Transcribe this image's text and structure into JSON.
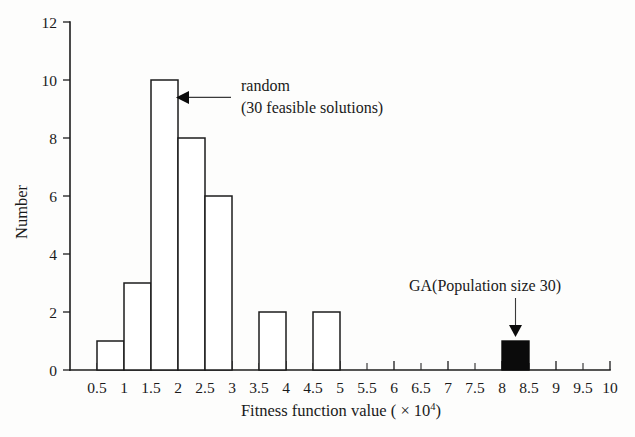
{
  "chart_data": {
    "type": "bar",
    "title": "",
    "xlabel": "Fitness function value ( × 10⁴)",
    "ylabel": "Number",
    "xlim": [
      0,
      10
    ],
    "ylim": [
      0,
      12
    ],
    "grid": false,
    "legend": "none",
    "xtick_labels": [
      "0.5",
      "1",
      "1.5",
      "2",
      "2.5",
      "3",
      "3.5",
      "4",
      "4.5",
      "5",
      "5.5",
      "6",
      "6.5",
      "7",
      "7.5",
      "8",
      "8.5",
      "9",
      "9.5",
      "10"
    ],
    "xtick_values": [
      0.5,
      1,
      1.5,
      2,
      2.5,
      3,
      3.5,
      4,
      4.5,
      5,
      5.5,
      6,
      6.5,
      7,
      7.5,
      8,
      8.5,
      9,
      9.5,
      10
    ],
    "ytick_labels": [
      "0",
      "2",
      "4",
      "6",
      "8",
      "10",
      "12"
    ],
    "ytick_values": [
      0,
      2,
      4,
      6,
      8,
      10,
      12
    ],
    "bin_width": 0.5,
    "series": [
      {
        "name": "random (30 feasible solutions)",
        "style": "open",
        "bins": [
          {
            "x0": 0.5,
            "x1": 1.0,
            "value": 1
          },
          {
            "x0": 1.0,
            "x1": 1.5,
            "value": 3
          },
          {
            "x0": 1.5,
            "x1": 2.0,
            "value": 10
          },
          {
            "x0": 2.0,
            "x1": 2.5,
            "value": 8
          },
          {
            "x0": 2.5,
            "x1": 3.0,
            "value": 6
          },
          {
            "x0": 3.5,
            "x1": 4.0,
            "value": 2
          },
          {
            "x0": 4.5,
            "x1": 5.0,
            "value": 2
          }
        ]
      },
      {
        "name": "GA(Population size 30)",
        "style": "filled",
        "bins": [
          {
            "x0": 8.0,
            "x1": 8.5,
            "value": 1
          }
        ]
      }
    ],
    "annotations": [
      {
        "id": "random",
        "line1": "random",
        "line2": "(30 feasible solutions)",
        "arrow": "left",
        "target_x": 2.0,
        "target_y": 9.4
      },
      {
        "id": "ga",
        "line1": "GA(Population size 30)",
        "line2": "",
        "arrow": "down",
        "target_x": 8.25,
        "target_y": 1.0
      }
    ]
  },
  "labels": {
    "xlabel_main": "Fitness function value ( × 10",
    "xlabel_exp": "4",
    "xlabel_close": ")"
  },
  "colors": {
    "ink": "#1a1a1a",
    "bar_fill": "#0b0b0b",
    "background": "#fdfdfc"
  }
}
